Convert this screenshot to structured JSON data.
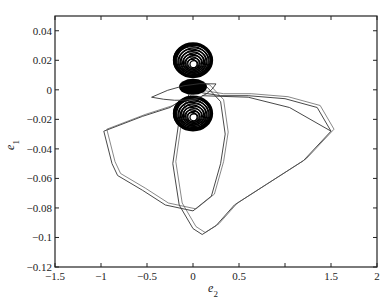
{
  "chart_data": {
    "type": "line",
    "title": "",
    "xlabel": "e2",
    "ylabel": "e1",
    "xlim": [
      -1.5,
      2
    ],
    "ylim": [
      -0.12,
      0.05
    ],
    "grid": false,
    "legend": null,
    "x_ticks": [
      -1.5,
      -1,
      -0.5,
      0,
      0.5,
      1,
      1.5,
      2
    ],
    "x_tick_labels": [
      "-1.5",
      "-1",
      "-0.5",
      "0",
      "0.5",
      "",
      "1.5",
      "2"
    ],
    "y_ticks": [
      0.04,
      0.02,
      0,
      -0.02,
      -0.04,
      -0.06,
      -0.08,
      -0.1,
      -0.12
    ],
    "y_tick_labels": [
      "0.04",
      "0.02",
      "0",
      "-0.02",
      "-0.04",
      "-0.06",
      "-0.08",
      "-0.1",
      "-0.12"
    ],
    "series": [
      {
        "name": "transient trajectory",
        "x": [
          -0.1,
          -0.25,
          -0.55,
          -0.97,
          -0.88,
          -0.82,
          -0.55,
          -0.3,
          0.0,
          0.2,
          0.3,
          0.35,
          0.3,
          0.15,
          0.0,
          -0.15,
          -0.22,
          -0.15,
          0.0,
          0.1,
          0.25,
          0.45,
          0.8,
          1.2,
          1.5,
          1.35,
          1.0,
          0.6,
          0.3,
          0.1,
          0.0
        ],
        "y": [
          -0.006,
          -0.012,
          -0.018,
          -0.028,
          -0.05,
          -0.058,
          -0.068,
          -0.078,
          -0.082,
          -0.072,
          -0.05,
          -0.03,
          -0.008,
          0.002,
          0.004,
          -0.02,
          -0.05,
          -0.078,
          -0.094,
          -0.098,
          -0.092,
          -0.078,
          -0.064,
          -0.048,
          -0.028,
          -0.012,
          -0.006,
          -0.004,
          -0.004,
          -0.002,
          0.0
        ]
      },
      {
        "name": "upper attractor lobe",
        "center": [
          0.0,
          0.02
        ],
        "radius_x": 0.2,
        "radius_y": 0.011
      },
      {
        "name": "lower attractor lobe",
        "center": [
          0.0,
          -0.016
        ],
        "radius_x": 0.2,
        "radius_y": 0.011
      }
    ]
  }
}
